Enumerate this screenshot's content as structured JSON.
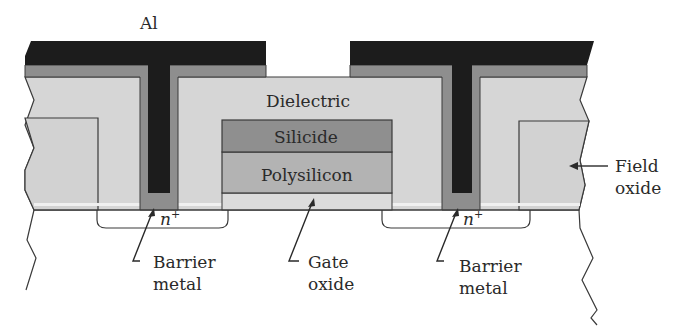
{
  "figure": {
    "colors": {
      "aluminum": "#1c1c1c",
      "barrier_metal": "#8e8e8e",
      "dielectric": "#d6d6d6",
      "field_oxide": "#d2d2d2",
      "silicide": "#8f8f8f",
      "polysilicon": "#b3b3b3",
      "gate_oxide": "#dcdcdc",
      "outline": "#3a3a3a",
      "substrate": "#ffffff"
    }
  },
  "labels": {
    "aluminum": "Al",
    "dielectric": "Dielectric",
    "silicide": "Silicide",
    "polysilicon": "Polysilicon",
    "n_plus_left": "n",
    "n_plus_left_sup": "+",
    "n_plus_right": "n",
    "n_plus_right_sup": "+",
    "barrier_left_line1": "Barrier",
    "barrier_left_line2": "metal",
    "gate_oxide_line1": "Gate",
    "gate_oxide_line2": "oxide",
    "barrier_right_line1": "Barrier",
    "barrier_right_line2": "metal",
    "field_oxide_line1": "Field",
    "field_oxide_line2": "oxide"
  }
}
